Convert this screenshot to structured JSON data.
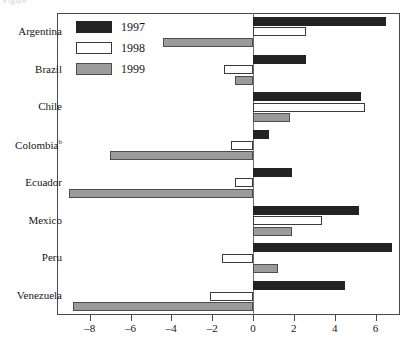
{
  "top_caption": "Figure",
  "chart_data": {
    "type": "bar",
    "orientation": "horizontal",
    "title": "",
    "xlabel": "",
    "ylabel": "",
    "grid": false,
    "legend_position": "top-left-inside",
    "xlim": [
      -9.6,
      7.2
    ],
    "xticks": [
      -8,
      -6,
      -4,
      -2,
      0,
      2,
      4,
      6
    ],
    "xticklabels": [
      "–8",
      "–6",
      "–4",
      "–2",
      "0",
      "2",
      "4",
      "6"
    ],
    "categories": [
      "Argentina",
      "Brazil",
      "Chile",
      "Colombiaᵇ",
      "Ecuador",
      "Mexico",
      "Peru",
      "Venezuela"
    ],
    "series": [
      {
        "name": "1997",
        "color": "#232323",
        "values": [
          6.5,
          2.6,
          5.3,
          0.8,
          1.9,
          5.2,
          6.8,
          4.5
        ]
      },
      {
        "name": "1998",
        "color": "#ffffff",
        "values": [
          2.6,
          -1.4,
          5.5,
          -1.1,
          -0.9,
          3.4,
          -1.5,
          -2.1
        ]
      },
      {
        "name": "1999",
        "color": "#9b9b9b",
        "values": [
          -4.4,
          -0.9,
          1.8,
          -7.0,
          -9.0,
          1.9,
          1.2,
          -8.8
        ]
      }
    ]
  },
  "legend": {
    "items": [
      {
        "label": "1997",
        "key": "y1997"
      },
      {
        "label": "1998",
        "key": "y1998"
      },
      {
        "label": "1999",
        "key": "y1999"
      }
    ]
  }
}
